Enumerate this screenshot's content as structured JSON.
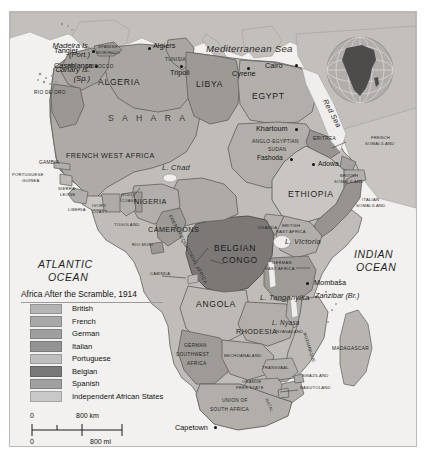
{
  "map": {
    "title": "Africa After the Scramble, 1914",
    "legend": [
      {
        "label": "British",
        "color": "#b4b4b4"
      },
      {
        "label": "French",
        "color": "#a8a8a8"
      },
      {
        "label": "German",
        "color": "#9e9e9e"
      },
      {
        "label": "Italian",
        "color": "#939393"
      },
      {
        "label": "Portuguese",
        "color": "#bdbdbd"
      },
      {
        "label": "Belgian",
        "color": "#787878"
      },
      {
        "label": "Spanish",
        "color": "#a0a0a0"
      },
      {
        "label": "Independent African States",
        "color": "#c8c8c8"
      }
    ],
    "scale": {
      "zero_top": "0",
      "top": "800 km",
      "zero_bottom": "0",
      "bottom": "800 mi"
    },
    "oceans": [
      {
        "name": "ATLANTIC OCEAN",
        "line1": "ATLANTIC",
        "line2": "OCEAN"
      },
      {
        "name": "INDIAN OCEAN",
        "line1": "INDIAN",
        "line2": "OCEAN"
      }
    ],
    "waters": [
      {
        "label": "Mediterranean Sea"
      },
      {
        "label": "Red Sea"
      },
      {
        "label": "L. Chad"
      },
      {
        "label": "L. Victoria"
      },
      {
        "label": "L. Tanganyika"
      },
      {
        "label": "L. Nyasa"
      }
    ],
    "islands": [
      {
        "line1": "Madeira Is.",
        "line2": "(Port.)"
      },
      {
        "line1": "Canary Is.",
        "line2": "(Sp.)"
      }
    ],
    "cities": [
      {
        "label": "Tangier"
      },
      {
        "label": "Casablanca"
      },
      {
        "label": "Algiers"
      },
      {
        "label": "Tripoli"
      },
      {
        "label": "Cyrene"
      },
      {
        "label": "Cairo"
      },
      {
        "label": "Khartoum"
      },
      {
        "label": "Fashoda"
      },
      {
        "label": "Adowa"
      },
      {
        "label": "Mombasa"
      },
      {
        "label": "Capetown"
      }
    ],
    "territories": [
      {
        "label": "SPANISH MOROCCO"
      },
      {
        "label": "MOROCCO"
      },
      {
        "label": "IFNI"
      },
      {
        "label": "RIO DE ORO"
      },
      {
        "label": "ALGERIA"
      },
      {
        "label": "TUNISIA"
      },
      {
        "label": "LIBYA"
      },
      {
        "label": "EGYPT"
      },
      {
        "label": "SAHARA"
      },
      {
        "label": "FRENCH WEST AFRICA"
      },
      {
        "label": "GAMBIA"
      },
      {
        "label": "PORTUGUESE GUINEA"
      },
      {
        "label": "SIERRA LEONE"
      },
      {
        "label": "LIBERIA"
      },
      {
        "label": "IVORY COAST"
      },
      {
        "label": "GOLD COAST"
      },
      {
        "label": "TOGOLAND"
      },
      {
        "label": "NIGERIA"
      },
      {
        "label": "CAMEROONS"
      },
      {
        "label": "RIO MUNI"
      },
      {
        "label": "FRENCH EQUATORIAL AFRICA"
      },
      {
        "label": "CABINDA"
      },
      {
        "label": "ANGLO-EGYPTIAN SUDAN"
      },
      {
        "label": "ERITREA"
      },
      {
        "label": "FRENCH SOMALILAND"
      },
      {
        "label": "BRITISH SOMALILAND"
      },
      {
        "label": "ITALIAN SOMALILAND"
      },
      {
        "label": "ETHIOPIA"
      },
      {
        "label": "UGANDA"
      },
      {
        "label": "BRITISH EAST AFRICA"
      },
      {
        "label": "BELGIAN CONGO"
      },
      {
        "label": "GERMAN EAST AFRICA"
      },
      {
        "label": "Zanzibar (Br.)"
      },
      {
        "label": "ANGOLA"
      },
      {
        "label": "RHODESIA"
      },
      {
        "label": "NYASALAND"
      },
      {
        "label": "MOZAMBIQUE"
      },
      {
        "label": "GERMAN SOUTHWEST AFRICA"
      },
      {
        "label": "BECHUANALAND"
      },
      {
        "label": "TRANSVAAL"
      },
      {
        "label": "ORANGE FREE STATE"
      },
      {
        "label": "NATAL"
      },
      {
        "label": "SWAZILAND"
      },
      {
        "label": "BASUTOLAND"
      },
      {
        "label": "UNION OF SOUTH AFRICA"
      },
      {
        "label": "MADAGASCAR"
      }
    ],
    "text": {
      "madeira_1": "Madeira Is.",
      "madeira_2": "(Port.)",
      "canary_1": "Canary Is.",
      "canary_2": "(Sp.)",
      "tangier": "Tangier",
      "casablanca": "Casablanca",
      "sp_morocco_1": "SPANISH",
      "sp_morocco_2": "MOROCCO",
      "morocco": "MOROCCO",
      "ifni": "IFNI",
      "rio_de_oro": "RIO DE ORO",
      "algiers": "Algiers",
      "tunisia": "TUNISIA",
      "tripoli": "Tripoli",
      "cyrene": "Cyrene",
      "cairo": "Cairo",
      "algeria": "ALGERIA",
      "libya": "LIBYA",
      "egypt": "EGYPT",
      "sahara": "S A H A R A",
      "mediterranean": "Mediterranean Sea",
      "red_sea": "Red Sea",
      "fwa_1": "FRENCH WEST AFRICA",
      "gambia": "GAMBIA",
      "port_guinea_1": "PORTUGUESE",
      "port_guinea_2": "GUINEA",
      "sierra_1": "SIERRA",
      "sierra_2": "LEONE",
      "liberia": "LIBERIA",
      "ivory_1": "IVORY",
      "ivory_2": "COAST",
      "gold_1": "GOLD",
      "gold_2": "COAST",
      "togoland": "TOGOLAND",
      "nigeria": "NIGERIA",
      "cameroons": "CAMEROONS",
      "rio_muni": "RIO MUNI",
      "fea": "FRENCH EQUATORIAL AFRICA",
      "cabinda": "CABINDA",
      "lchad": "L. Chad",
      "khartoum": "Khartoum",
      "aes_1": "ANGLO-EGYPTIAN",
      "aes_2": "SUDAN",
      "fashoda": "Fashoda",
      "eritrea": "ERITREA",
      "adowa": "Adowa",
      "fsom_1": "FRENCH",
      "fsom_2": "SOMALILAND",
      "bsom_1": "BRITISH",
      "bsom_2": "SOMALILAND",
      "isom_1": "ITALIAN",
      "isom_2": "SOMALILAND",
      "ethiopia": "ETHIOPIA",
      "uganda": "UGANDA",
      "bea_1": "BRITISH",
      "bea_2": "EAST AFRICA",
      "lvictoria": "L. Victoria",
      "belgian_1": "BELGIAN",
      "belgian_2": "CONGO",
      "gea_1": "GERMAN",
      "gea_2": "EAST AFRICA",
      "mombasa": "Mombasa",
      "zanzibar": "Zanzibar (Br.)",
      "ltanganyika": "L. Tanganyika",
      "lnyasa": "L. Nyasa",
      "nyasaland": "NYASALAND",
      "mozambique": "MOZAMBIQUE",
      "angola": "ANGOLA",
      "rhodesia": "RHODESIA",
      "gswa_1": "GERMAN",
      "gswa_2": "SOUTHWEST",
      "gswa_3": "AFRICA",
      "bechuanaland": "BECHUANALAND",
      "transvaal": "TRANSVAAL",
      "ofs_1": "ORANGE",
      "ofs_2": "FREE STATE",
      "natal": "NATAL",
      "swaziland": "SWAZILAND",
      "basutoland": "BASUTOLAND",
      "usa_1": "UNION OF",
      "usa_2": "SOUTH AFRICA",
      "capetown": "Capetown",
      "madagascar": "MADAGASCAR",
      "atlantic_1": "ATLANTIC",
      "atlantic_2": "OCEAN",
      "indian_1": "INDIAN",
      "indian_2": "OCEAN"
    }
  }
}
